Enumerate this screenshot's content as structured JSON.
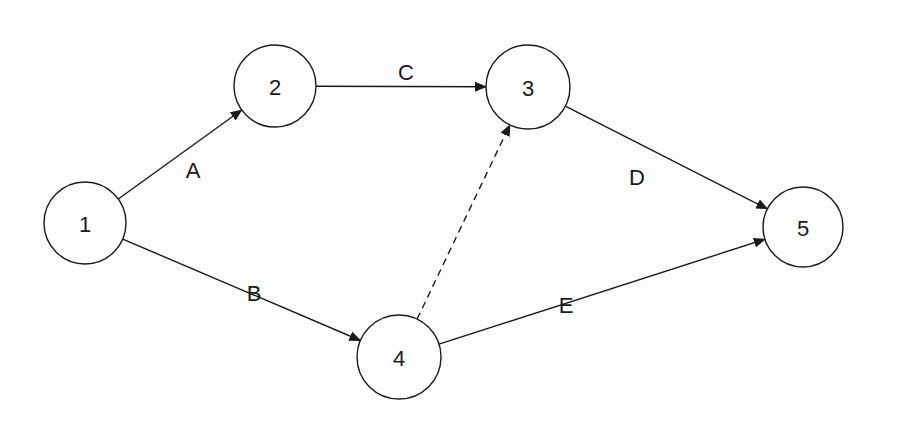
{
  "diagram": {
    "type": "activity-on-arrow network",
    "style": {
      "background": "#fdfdfd",
      "stroke": "#1a1a1a",
      "node_fill": "#ffffff"
    },
    "nodes": [
      {
        "id": "1",
        "label": "1",
        "cx": 85,
        "cy": 223,
        "r": 41
      },
      {
        "id": "2",
        "label": "2",
        "cx": 275,
        "cy": 86,
        "r": 41
      },
      {
        "id": "3",
        "label": "3",
        "cx": 528,
        "cy": 87,
        "r": 42
      },
      {
        "id": "4",
        "label": "4",
        "cx": 399,
        "cy": 357,
        "r": 42
      },
      {
        "id": "5",
        "label": "5",
        "cx": 803,
        "cy": 227,
        "r": 40
      }
    ],
    "edges": [
      {
        "id": "A",
        "label": "A",
        "from": "1",
        "to": "2",
        "dashed": false,
        "label_x": 193,
        "label_y": 170
      },
      {
        "id": "B",
        "label": "B",
        "from": "1",
        "to": "4",
        "dashed": false,
        "label_x": 254,
        "label_y": 293
      },
      {
        "id": "C",
        "label": "C",
        "from": "2",
        "to": "3",
        "dashed": false,
        "label_x": 406,
        "label_y": 72
      },
      {
        "id": "D",
        "label": "D",
        "from": "3",
        "to": "5",
        "dashed": false,
        "label_x": 637,
        "label_y": 177
      },
      {
        "id": "E",
        "label": "E",
        "from": "4",
        "to": "5",
        "dashed": false,
        "label_x": 566,
        "label_y": 305
      },
      {
        "id": "dummy",
        "label": "",
        "from": "4",
        "to": "3",
        "dashed": true
      }
    ]
  }
}
